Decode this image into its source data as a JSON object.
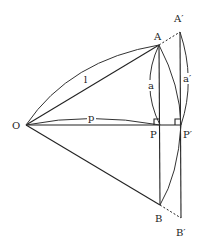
{
  "diagram": {
    "points": {
      "O": {
        "label": "O",
        "x": 26,
        "y": 125
      },
      "A": {
        "label": "A",
        "x": 159,
        "y": 45
      },
      "A_prime": {
        "label": "A′",
        "x": 180,
        "y": 32
      },
      "P": {
        "label": "P",
        "x": 160,
        "y": 125
      },
      "P_prime": {
        "label": "P′",
        "x": 181,
        "y": 125
      },
      "B": {
        "label": "B",
        "x": 160,
        "y": 205
      },
      "B_prime": {
        "label": "B′",
        "x": 181,
        "y": 218
      }
    },
    "segment_labels": {
      "l": "l",
      "p": "p",
      "a": "a",
      "a_prime": "a′"
    }
  }
}
